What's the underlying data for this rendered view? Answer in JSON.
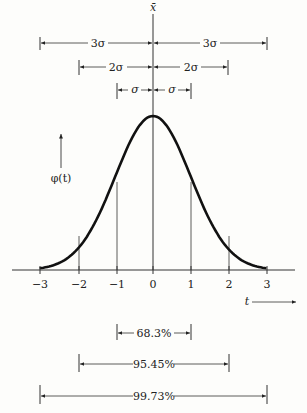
{
  "chart_data": {
    "type": "line",
    "title": "",
    "xlabel": "t",
    "ylabel": "φ(t)",
    "top_label": "x̄",
    "x_ticks": [
      "−3",
      "−2",
      "−1",
      "0",
      "1",
      "2",
      "3"
    ],
    "xlim": [
      -3,
      3
    ],
    "curve": "standard normal density φ(t)",
    "x": [
      -3,
      -2,
      -1,
      0,
      1,
      2,
      3
    ],
    "y": [
      0.0044,
      0.054,
      0.242,
      0.399,
      0.242,
      0.054,
      0.0044
    ],
    "sigma_spans": [
      {
        "label": "3σ",
        "left": "3σ",
        "right": "3σ"
      },
      {
        "label": "2σ",
        "left": "2σ",
        "right": "2σ"
      },
      {
        "label": "σ",
        "left": "σ",
        "right": "σ"
      }
    ],
    "probability_intervals": [
      {
        "range": [
          -1,
          1
        ],
        "label": "68.3%"
      },
      {
        "range": [
          -2,
          2
        ],
        "label": "95.45%"
      },
      {
        "range": [
          -3,
          3
        ],
        "label": "99.73%"
      }
    ]
  },
  "labels": {
    "top": "x̄",
    "three_sigma": "3σ",
    "two_sigma": "2σ",
    "one_sigma": "σ",
    "phi": "φ(t)",
    "t": "t",
    "p1": "68.3%",
    "p2": "95.45%",
    "p3": "99.73%",
    "ticks": [
      "−3",
      "−2",
      "−1",
      "0",
      "1",
      "2",
      "3"
    ]
  }
}
